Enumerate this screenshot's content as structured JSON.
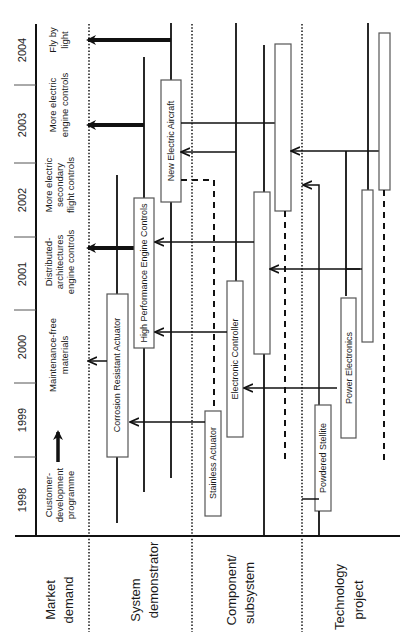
{
  "diagram": {
    "orientation": "rotated-90-ccw",
    "colors": {
      "line": "#111111",
      "box_border": "#888888",
      "text": "#1a1a1a",
      "background": "#ffffff"
    }
  },
  "years": [
    "1998",
    "1999",
    "2000",
    "2001",
    "2002",
    "2003",
    "2004"
  ],
  "lanes": {
    "market": "Market demand",
    "market_l1": "Market",
    "market_l2": "demand",
    "system": "System demonstrator",
    "system_l1": "System",
    "system_l2": "demonstrator",
    "component": "Component/ subsystem",
    "component_l1": "Component/",
    "component_l2": "subsystem",
    "technology": "Technology project",
    "technology_l1": "Technology",
    "technology_l2": "project"
  },
  "market_demands": {
    "customer_l1": "Customer-",
    "customer_l2": "development",
    "customer_l3": "programme",
    "maint_l1": "Maintenance-free",
    "maint_l2": "materials",
    "dist_l1": "Distributed-",
    "dist_l2": "architectures",
    "dist_l3": "engine controls",
    "secondary_l1": "More electric",
    "secondary_l2": "secondary",
    "secondary_l3": "flight controls",
    "engine_l1": "More electric",
    "engine_l2": "engine controls",
    "fly_l1": "Fly by",
    "fly_l2": "light"
  },
  "boxes": {
    "corrosion": "Corrosion Resistant Actuator",
    "hpec": "High Performance Engine Controls",
    "nea": "New Electric Aircraft",
    "stainless": "Stainless Actuator",
    "electronic": "Electronic Controller",
    "powdered": "Powdered  Stellite",
    "power": "Power Electronics"
  },
  "legend": {
    "arrow_meaning": "Customer-development programme"
  }
}
